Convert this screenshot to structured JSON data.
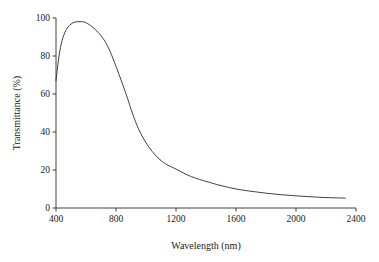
{
  "chart_data": {
    "type": "line",
    "title": "",
    "xlabel": "Wavelength (nm)",
    "ylabel": "Transmittance (%)",
    "xlim": [
      400,
      2400
    ],
    "ylim": [
      0,
      100
    ],
    "xticks": [
      400,
      800,
      1200,
      1600,
      2000,
      2400
    ],
    "yticks": [
      0,
      20,
      40,
      60,
      80,
      100
    ],
    "xtick_labels": [
      "400",
      "800",
      "1200",
      "1600",
      "2000",
      "2400"
    ],
    "ytick_labels": [
      "0",
      "20",
      "40",
      "60",
      "80",
      "100"
    ],
    "grid": false,
    "legend": "none",
    "line_color": "#2b2b2b",
    "background_color": "#ffffff",
    "series": [
      {
        "name": "Transmittance",
        "x": [
          400,
          420,
          440,
          460,
          480,
          500,
          520,
          540,
          560,
          580,
          600,
          640,
          680,
          720,
          760,
          800,
          840,
          880,
          900,
          940,
          980,
          1020,
          1060,
          1100,
          1140,
          1200,
          1260,
          1320,
          1400,
          1500,
          1600,
          1700,
          1800,
          1900,
          2000,
          2100,
          2200,
          2330
        ],
        "y": [
          67.0,
          80.0,
          88.0,
          92.5,
          95.2,
          96.8,
          97.7,
          98.0,
          98.1,
          98.0,
          97.5,
          95.5,
          92.5,
          88.5,
          82.5,
          74.5,
          66.0,
          57.0,
          52.0,
          43.5,
          37.0,
          32.0,
          28.0,
          25.0,
          22.8,
          20.5,
          18.0,
          16.0,
          14.0,
          11.8,
          10.0,
          8.8,
          7.8,
          7.0,
          6.4,
          5.9,
          5.5,
          5.2
        ]
      }
    ],
    "annotations": {
      "peak_value": 98.1,
      "peak_wavelength": 560,
      "start_value": 67.0,
      "end_value": 5.2
    }
  },
  "axes": {
    "x_axis_name": "wavelength-axis",
    "y_axis_name": "transmittance-axis"
  }
}
